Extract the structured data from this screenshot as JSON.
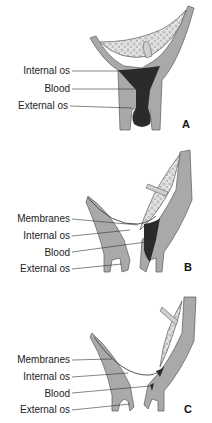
{
  "figure": {
    "colors": {
      "wall": "#a9a9a9",
      "wall_edge": "#5a5a5a",
      "placenta": "#e2e2e2",
      "blood": "#2b2b2b",
      "cord": "#cfcfcf",
      "leader": "#333333"
    },
    "panels": [
      {
        "letter": "A",
        "labels": [
          "Internal os",
          "Blood",
          "External os"
        ]
      },
      {
        "letter": "B",
        "labels": [
          "Membranes",
          "Internal os",
          "Blood",
          "External os"
        ]
      },
      {
        "letter": "C",
        "labels": [
          "Membranes",
          "Internal os",
          "Blood",
          "External os"
        ]
      }
    ]
  }
}
